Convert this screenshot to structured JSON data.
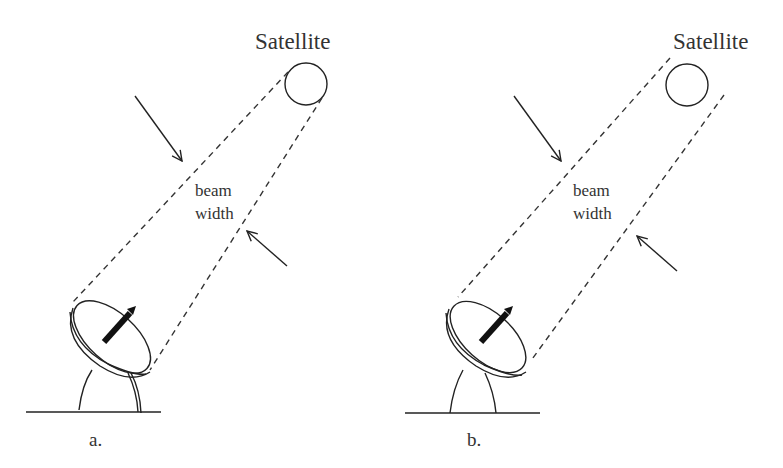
{
  "figure": {
    "panels": [
      {
        "id": "a",
        "label": "a.",
        "satellite_label": "Satellite",
        "beam_label_line1": "beam",
        "beam_label_line2": "width",
        "note": "Beam narrowly encloses the satellite"
      },
      {
        "id": "b",
        "label": "b.",
        "satellite_label": "Satellite",
        "beam_label_line1": "beam",
        "beam_label_line2": "width",
        "note": "Beam wider than the satellite"
      }
    ]
  },
  "colors": {
    "line": "#222222",
    "text": "#333333",
    "background": "#ffffff"
  }
}
